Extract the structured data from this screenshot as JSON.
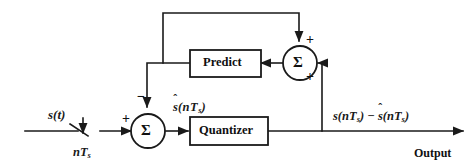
{
  "diagram": {
    "blocks": [
      {
        "id": "predict",
        "label": "Predict"
      },
      {
        "id": "quantizer",
        "label": "Quantizer"
      }
    ],
    "summing_junctions": [
      {
        "id": "sum-main",
        "symbol": "Σ"
      },
      {
        "id": "sum-feedback",
        "symbol": "Σ"
      }
    ],
    "signs": {
      "main_plus": "+",
      "main_minus": "−",
      "feedback_top_plus": "+",
      "feedback_right_plus": "+"
    },
    "labels": {
      "input_signal": "s(t)",
      "sample_rate": "nT",
      "sample_rate_sub": "s",
      "predicted": "(nT",
      "predicted_sub": "s",
      "predicted_close": ")",
      "predicted_hat_char": "s",
      "output_expr_a": "s(nT",
      "output_expr_a_sub": "s",
      "output_expr_mid": ") − ",
      "output_expr_b_hat": "s",
      "output_expr_b": "(nT",
      "output_expr_b_sub": "s",
      "output_expr_close": ")",
      "output_word": "Output"
    },
    "colors": {
      "line": "#1a1a1a",
      "text": "#101010",
      "background": "#ffffff"
    }
  }
}
